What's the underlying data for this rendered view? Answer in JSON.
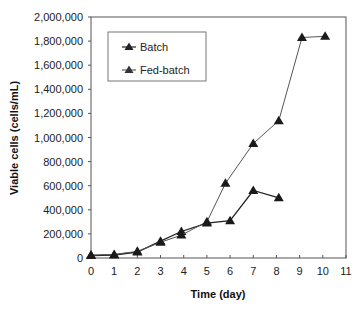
{
  "chart_data": {
    "type": "line",
    "title": "",
    "xlabel": "Time (day)",
    "ylabel": "Viable cells (cells/mL)",
    "xlim": [
      0,
      11
    ],
    "ylim": [
      0,
      2000000
    ],
    "x_ticks": [
      "0",
      "1",
      "2",
      "3",
      "4",
      "5",
      "6",
      "7",
      "8",
      "9",
      "10",
      "11"
    ],
    "y_ticks": [
      "0",
      "200,000",
      "400,000",
      "600,000",
      "800,000",
      "1,000,000",
      "1,200,000",
      "1,400,000",
      "1,600,000",
      "1,800,000",
      "2,000,000"
    ],
    "grid": false,
    "legend_position": "upper left (inside)",
    "marker": "triangle",
    "series": [
      {
        "name": "Batch",
        "x": [
          0,
          1,
          2,
          3,
          3.9,
          5,
          6,
          7,
          8.1
        ],
        "values": [
          20000,
          25000,
          50000,
          140000,
          220000,
          290000,
          310000,
          560000,
          500000
        ]
      },
      {
        "name": "Fed-batch",
        "x": [
          0,
          1,
          2,
          3,
          3.9,
          5,
          5.8,
          7,
          8.1,
          9.1,
          10.1
        ],
        "values": [
          25000,
          30000,
          55000,
          130000,
          190000,
          300000,
          620000,
          950000,
          1140000,
          1830000,
          1840000
        ]
      }
    ]
  },
  "legend": {
    "items": [
      {
        "label": "Batch"
      },
      {
        "label": "Fed-batch"
      }
    ]
  }
}
